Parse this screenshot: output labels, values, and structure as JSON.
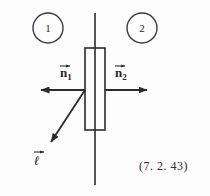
{
  "figure": {
    "equation_number": "(7. 2. 43)",
    "stroke_color": "#2b2b2b",
    "background_color": "#fdfdfd",
    "regions": [
      {
        "id": "region-1",
        "label": "1",
        "cx": 48,
        "cy": 28,
        "r": 15
      },
      {
        "id": "region-2",
        "label": "2",
        "cx": 142,
        "cy": 28,
        "r": 15
      }
    ],
    "vectors": [
      {
        "id": "n1",
        "base": "n",
        "subscript": "1",
        "accent": "arrow",
        "direction": "left",
        "from": [
          85,
          90
        ],
        "to": [
          40,
          90
        ]
      },
      {
        "id": "n2",
        "base": "n",
        "subscript": "2",
        "accent": "arrow",
        "direction": "right",
        "from": [
          105,
          90
        ],
        "to": [
          148,
          90
        ]
      },
      {
        "id": "l",
        "base": "ℓ",
        "subscript": "",
        "accent": "arrow",
        "direction": "down-left",
        "from": [
          85,
          90
        ],
        "to": [
          50,
          143
        ]
      }
    ],
    "interface_line": {
      "x": 95,
      "y_top": 13,
      "y_bottom": 185
    },
    "slab": {
      "x": 85,
      "y": 48,
      "width": 20,
      "height": 82
    }
  }
}
